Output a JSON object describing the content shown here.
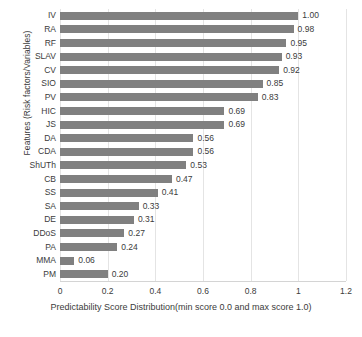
{
  "chart_data": {
    "type": "bar",
    "orientation": "horizontal",
    "title": "",
    "xlabel": "Predictability Score Distribution(min score 0.0 and max score 1.0)",
    "ylabel": "Features (Risk factors/Variables)",
    "xlim": [
      0,
      1.2
    ],
    "xticks": [
      "0",
      "0.2",
      "0.4",
      "0.6",
      "0.8",
      "1",
      "1.2"
    ],
    "xtick_values": [
      0,
      0.2,
      0.4,
      0.6,
      0.8,
      1,
      1.2
    ],
    "grid": true,
    "grid_axis": "x",
    "legend": "none",
    "bar_color": "#808080",
    "categories": [
      "IV",
      "RA",
      "RF",
      "SLAV",
      "CV",
      "SIO",
      "PV",
      "HIC",
      "JS",
      "DA",
      "CDA",
      "ShUTh",
      "CB",
      "SS",
      "SA",
      "DE",
      "DDoS",
      "PA",
      "MMA",
      "PM"
    ],
    "values": [
      1.0,
      0.98,
      0.95,
      0.93,
      0.92,
      0.85,
      0.83,
      0.69,
      0.69,
      0.56,
      0.56,
      0.53,
      0.47,
      0.41,
      0.33,
      0.31,
      0.27,
      0.24,
      0.06,
      0.2
    ],
    "data_labels": [
      "1.00",
      "0.98",
      "0.95",
      "0.93",
      "0.92",
      "0.85",
      "0.83",
      "0.69",
      "0.69",
      "0.56",
      "0.56",
      "0.53",
      "0.47",
      "0.41",
      "0.33",
      "0.31",
      "0.27",
      "0.24",
      "0.06",
      "0.20"
    ]
  }
}
